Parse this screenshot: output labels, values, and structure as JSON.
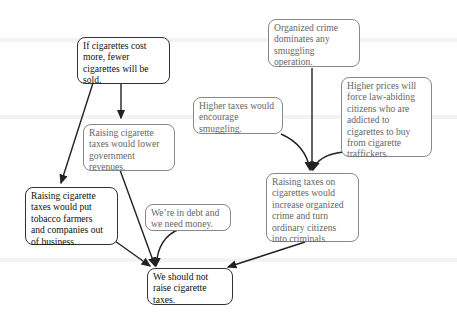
{
  "diagram": {
    "type": "argument-map",
    "nodes": [
      {
        "id": "n1",
        "text": "If cigarettes cost\nmore, fewer\ncigarettes will be\nsold.",
        "style": "dark"
      },
      {
        "id": "n2",
        "text": "Raising cigarette\ntaxes would lower\ngovernment\nrevenues.",
        "style": "gray"
      },
      {
        "id": "n3",
        "text": "Raising cigarette\ntaxes would put\ntobacco farmers\nand companies out\nof business.",
        "style": "dark"
      },
      {
        "id": "n4",
        "text": "We’re in debt and\nwe need money.",
        "style": "gray"
      },
      {
        "id": "n5",
        "text": "We should not\nraise cigarette\ntaxes.",
        "style": "dark"
      },
      {
        "id": "n6",
        "text": "Organized crime\ndominates any\nsmuggling\noperation.",
        "style": "gray"
      },
      {
        "id": "n7",
        "text": "Higher taxes would\nencourage\nsmuggling.",
        "style": "gray"
      },
      {
        "id": "n8",
        "text": "Higher prices will\nforce law-abiding\ncitizens who are\naddicted to\ncigarettes to buy\nfrom cigarette\ntraffickers.",
        "style": "gray"
      },
      {
        "id": "n9",
        "text": "Raising taxes on\ncigarettes would\nincrease organized\ncrime and turn\nordinary citizens\ninto criminals.",
        "style": "gray"
      }
    ],
    "edges": [
      {
        "from": "n1",
        "to": "n2"
      },
      {
        "from": "n1",
        "to": "n3"
      },
      {
        "from": "n2",
        "to": "n5"
      },
      {
        "from": "n3",
        "to": "n5"
      },
      {
        "from": "n4",
        "to": "n5"
      },
      {
        "from": "n9",
        "to": "n5"
      },
      {
        "from": "n6",
        "to": "n9"
      },
      {
        "from": "n7",
        "to": "n9"
      },
      {
        "from": "n8",
        "to": "n9"
      }
    ],
    "colors": {
      "dark_border": "#333333",
      "gray_border": "#888888",
      "gray_text": "#666666",
      "arrow": "#222222"
    }
  }
}
